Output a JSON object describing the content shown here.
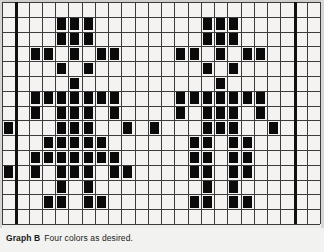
{
  "chart_data": {
    "type": "heatmap",
    "title": "Graph B",
    "subtitle": "Four colors as desired.",
    "xlabel": "",
    "ylabel": "",
    "columns": 24,
    "rows": 15,
    "grid": true,
    "legend": "none",
    "cell_states": [
      "empty",
      "filled"
    ],
    "filled_color": "#0a0a0a",
    "empty_color": "#f4f3f1",
    "gridline_color": "#3c3c3c",
    "repeat_marker_color": "#101010",
    "repeat_marker_columns": [
      1,
      22
    ],
    "filled_cells": [
      [
        1,
        4
      ],
      [
        1,
        5
      ],
      [
        1,
        6
      ],
      [
        1,
        15
      ],
      [
        1,
        16
      ],
      [
        1,
        17
      ],
      [
        2,
        4
      ],
      [
        2,
        5
      ],
      [
        2,
        6
      ],
      [
        2,
        15
      ],
      [
        2,
        16
      ],
      [
        2,
        17
      ],
      [
        3,
        2
      ],
      [
        3,
        3
      ],
      [
        3,
        5
      ],
      [
        3,
        7
      ],
      [
        3,
        8
      ],
      [
        3,
        13
      ],
      [
        3,
        14
      ],
      [
        3,
        16
      ],
      [
        3,
        18
      ],
      [
        3,
        19
      ],
      [
        4,
        4
      ],
      [
        4,
        6
      ],
      [
        4,
        15
      ],
      [
        4,
        17
      ],
      [
        5,
        5
      ],
      [
        5,
        16
      ],
      [
        6,
        2
      ],
      [
        6,
        3
      ],
      [
        6,
        4
      ],
      [
        6,
        5
      ],
      [
        6,
        6
      ],
      [
        6,
        7
      ],
      [
        6,
        8
      ],
      [
        6,
        13
      ],
      [
        6,
        14
      ],
      [
        6,
        15
      ],
      [
        6,
        16
      ],
      [
        6,
        17
      ],
      [
        6,
        18
      ],
      [
        6,
        19
      ],
      [
        7,
        2
      ],
      [
        7,
        4
      ],
      [
        7,
        5
      ],
      [
        7,
        6
      ],
      [
        7,
        8
      ],
      [
        7,
        13
      ],
      [
        7,
        15
      ],
      [
        7,
        16
      ],
      [
        7,
        17
      ],
      [
        7,
        19
      ],
      [
        8,
        0
      ],
      [
        8,
        4
      ],
      [
        8,
        5
      ],
      [
        8,
        6
      ],
      [
        8,
        9
      ],
      [
        8,
        11
      ],
      [
        8,
        15
      ],
      [
        8,
        16
      ],
      [
        8,
        17
      ],
      [
        8,
        20
      ],
      [
        9,
        3
      ],
      [
        9,
        4
      ],
      [
        9,
        5
      ],
      [
        9,
        6
      ],
      [
        9,
        7
      ],
      [
        9,
        14
      ],
      [
        9,
        15
      ],
      [
        9,
        17
      ],
      [
        9,
        18
      ],
      [
        10,
        2
      ],
      [
        10,
        3
      ],
      [
        10,
        4
      ],
      [
        10,
        5
      ],
      [
        10,
        6
      ],
      [
        10,
        7
      ],
      [
        10,
        8
      ],
      [
        10,
        14
      ],
      [
        10,
        15
      ],
      [
        10,
        17
      ],
      [
        10,
        18
      ],
      [
        11,
        0
      ],
      [
        11,
        2
      ],
      [
        11,
        4
      ],
      [
        11,
        5
      ],
      [
        11,
        6
      ],
      [
        11,
        8
      ],
      [
        11,
        9
      ],
      [
        11,
        14
      ],
      [
        11,
        15
      ],
      [
        11,
        17
      ],
      [
        11,
        18
      ],
      [
        12,
        4
      ],
      [
        12,
        6
      ],
      [
        12,
        15
      ],
      [
        12,
        17
      ],
      [
        13,
        3
      ],
      [
        13,
        4
      ],
      [
        13,
        6
      ],
      [
        13,
        7
      ],
      [
        13,
        14
      ],
      [
        13,
        15
      ],
      [
        13,
        17
      ],
      [
        13,
        18
      ]
    ]
  },
  "caption": {
    "label": "Graph B",
    "text": "Four colors as desired."
  }
}
